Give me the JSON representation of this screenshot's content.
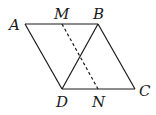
{
  "diagram": {
    "type": "geometry",
    "shape": "parallelogram",
    "points": {
      "A": {
        "label": "A",
        "x": 25,
        "y": 24
      },
      "B": {
        "label": "B",
        "x": 98,
        "y": 24
      },
      "C": {
        "label": "C",
        "x": 135,
        "y": 89
      },
      "D": {
        "label": "D",
        "x": 62,
        "y": 89
      },
      "M": {
        "label": "M",
        "x": 62,
        "y": 24
      },
      "N": {
        "label": "N",
        "x": 98,
        "y": 89
      }
    },
    "segments": [
      {
        "from": "A",
        "to": "B",
        "style": "solid"
      },
      {
        "from": "B",
        "to": "C",
        "style": "solid"
      },
      {
        "from": "C",
        "to": "D",
        "style": "solid"
      },
      {
        "from": "D",
        "to": "A",
        "style": "solid"
      },
      {
        "from": "B",
        "to": "D",
        "style": "solid"
      },
      {
        "from": "M",
        "to": "N",
        "style": "dashed"
      }
    ],
    "line_color": "#1a1a1a"
  }
}
